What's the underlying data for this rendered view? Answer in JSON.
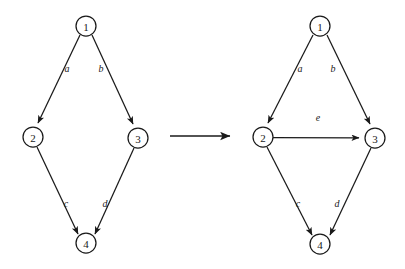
{
  "figure": {
    "background_color": "#ffffff",
    "stroke_color": "#1a1a1a"
  },
  "left_graph": {
    "name": "source-graph",
    "nodes": [
      {
        "id": "1",
        "label": "1",
        "cx": 86,
        "cy": 26,
        "r": 10
      },
      {
        "id": "2",
        "label": "2",
        "cx": 33,
        "cy": 137,
        "r": 10
      },
      {
        "id": "3",
        "label": "3",
        "cx": 138,
        "cy": 138,
        "r": 10
      },
      {
        "id": "4",
        "label": "4",
        "cx": 86,
        "cy": 243,
        "r": 10
      }
    ],
    "edges": [
      {
        "id": "a",
        "label": "a",
        "from": "1",
        "to": "2",
        "label_x": 67,
        "label_y": 68
      },
      {
        "id": "b",
        "label": "b",
        "from": "1",
        "to": "3",
        "label_x": 101,
        "label_y": 68
      },
      {
        "id": "c",
        "label": "c",
        "from": "2",
        "to": "4",
        "label_x": 66,
        "label_y": 203
      },
      {
        "id": "d",
        "label": "d",
        "from": "3",
        "to": "4",
        "label_x": 105,
        "label_y": 203
      }
    ]
  },
  "transform_arrow": {
    "name": "transformation-arrow",
    "x1": 170,
    "y1": 136,
    "x2": 234,
    "y2": 136
  },
  "right_graph": {
    "name": "result-graph",
    "nodes": [
      {
        "id": "1",
        "label": "1",
        "cx": 320,
        "cy": 26,
        "r": 10
      },
      {
        "id": "2",
        "label": "2",
        "cx": 263,
        "cy": 137,
        "r": 10
      },
      {
        "id": "3",
        "label": "3",
        "cx": 375,
        "cy": 138,
        "r": 10
      },
      {
        "id": "4",
        "label": "4",
        "cx": 320,
        "cy": 244,
        "r": 10
      }
    ],
    "edges": [
      {
        "id": "a",
        "label": "a",
        "from": "1",
        "to": "2",
        "label_x": 300,
        "label_y": 68
      },
      {
        "id": "b",
        "label": "b",
        "from": "1",
        "to": "3",
        "label_x": 333,
        "label_y": 68
      },
      {
        "id": "e",
        "label": "e",
        "from": "2",
        "to": "3",
        "label_x": 318,
        "label_y": 117
      },
      {
        "id": "c",
        "label": "c",
        "from": "2",
        "to": "4",
        "label_x": 298,
        "label_y": 203
      },
      {
        "id": "d",
        "label": "d",
        "from": "3",
        "to": "4",
        "label_x": 337,
        "label_y": 203
      }
    ]
  }
}
